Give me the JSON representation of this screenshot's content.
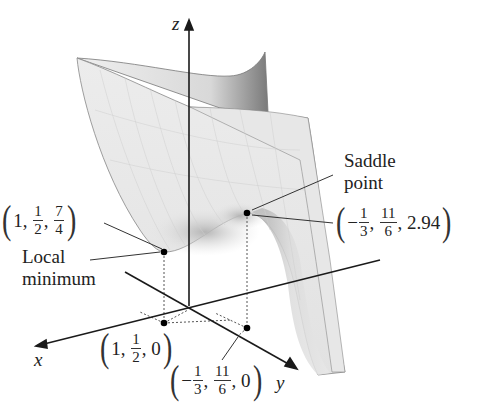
{
  "axes": {
    "x_label": "x",
    "y_label": "y",
    "z_label": "z"
  },
  "annotations": {
    "local_min": {
      "title_line1": "Local",
      "title_line2": "minimum",
      "point": {
        "a": "1",
        "b_num": "1",
        "b_den": "2",
        "c_num": "7",
        "c_den": "4"
      },
      "projection": {
        "a": "1",
        "b_num": "1",
        "b_den": "2",
        "c": "0"
      }
    },
    "saddle": {
      "title_line1": "Saddle",
      "title_line2": "point",
      "point": {
        "a_sign": "−",
        "a_num": "1",
        "a_den": "3",
        "b_num": "11",
        "b_den": "6",
        "c": "2.94"
      },
      "projection": {
        "a_sign": "−",
        "a_num": "1",
        "a_den": "3",
        "b_num": "11",
        "b_den": "6",
        "c": "0"
      }
    }
  },
  "colors": {
    "surface_fill": "#e4e4e4",
    "surface_dark": "#9a9a9a",
    "axis": "#1a1a1a",
    "text": "#222222"
  }
}
